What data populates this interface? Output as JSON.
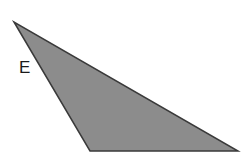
{
  "diagram": {
    "shape": "triangle",
    "vertices": [
      [
        14,
        22
      ],
      [
        90,
        151
      ],
      [
        238,
        151
      ]
    ],
    "fill": "#8c8c8c",
    "stroke": "#3a3a3a",
    "stroke_width": 1.5
  },
  "labels": {
    "side_label": "E"
  }
}
